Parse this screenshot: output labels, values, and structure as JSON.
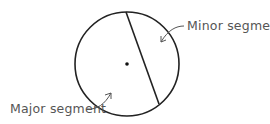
{
  "diagram": {
    "labels": {
      "minor": "Minor segment",
      "major": "Major segment"
    },
    "colors": {
      "stroke": "#222222",
      "label": "#555555"
    }
  }
}
